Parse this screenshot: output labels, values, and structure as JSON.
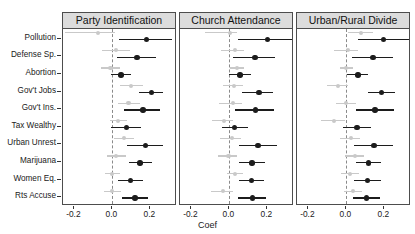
{
  "chart_data": {
    "type": "scatter",
    "title": "",
    "xlabel": "Coef",
    "ylabel": "",
    "xlim": [
      -0.26,
      0.34
    ],
    "xticks": [
      -0.2,
      0.0,
      0.2
    ],
    "xticklabels": [
      "-0.2",
      "0.0",
      "0.2"
    ],
    "grid": false,
    "legend_position": "none",
    "zero_reference_line": 0.0,
    "categories": [
      "Pollution",
      "Defense Sp.",
      "Abortion",
      "Gov't Jobs",
      "Gov't Ins.",
      "Tax Wealthy",
      "Urban Unrest",
      "Marijuana",
      "Women Eq.",
      "Rts Accuse"
    ],
    "panels": [
      {
        "title": "Party Identification",
        "series": [
          {
            "name": "light-estimate",
            "color": "#c9c9c9",
            "points": [
              {
                "category": "Pollution",
                "coef": -0.075,
                "ci_low": -0.25,
                "ci_high": 0.015
              },
              {
                "category": "Defense Sp.",
                "coef": 0.02,
                "ci_low": -0.055,
                "ci_high": 0.092
              },
              {
                "category": "Abortion",
                "coef": -0.01,
                "ci_low": -0.06,
                "ci_high": 0.04
              },
              {
                "category": "Gov't Jobs",
                "coef": 0.1,
                "ci_low": 0.04,
                "ci_high": 0.16
              },
              {
                "category": "Gov't Ins.",
                "coef": 0.085,
                "ci_low": 0.03,
                "ci_high": 0.145
              },
              {
                "category": "Tax Wealthy",
                "coef": 0.03,
                "ci_low": -0.015,
                "ci_high": 0.075
              },
              {
                "category": "Urban Unrest",
                "coef": 0.06,
                "ci_low": 0.01,
                "ci_high": 0.115
              },
              {
                "category": "Marijuana",
                "coef": 0.02,
                "ci_low": -0.03,
                "ci_high": 0.07
              },
              {
                "category": "Women Eq.",
                "coef": 0.0,
                "ci_low": -0.04,
                "ci_high": 0.042
              },
              {
                "category": "Rts Accuse",
                "coef": 0.0,
                "ci_low": -0.045,
                "ci_high": 0.045
              }
            ]
          },
          {
            "name": "dark-estimate",
            "color": "#1c1c1c",
            "points": [
              {
                "category": "Pollution",
                "coef": 0.18,
                "ci_low": 0.035,
                "ci_high": 0.315
              },
              {
                "category": "Defense Sp.",
                "coef": 0.13,
                "ci_low": 0.022,
                "ci_high": 0.228
              },
              {
                "category": "Abortion",
                "coef": 0.045,
                "ci_low": -0.005,
                "ci_high": 0.098
              },
              {
                "category": "Gov't Jobs",
                "coef": 0.205,
                "ci_low": 0.14,
                "ci_high": 0.268
              },
              {
                "category": "Gov't Ins.",
                "coef": 0.16,
                "ci_low": 0.06,
                "ci_high": 0.252
              },
              {
                "category": "Tax Wealthy",
                "coef": 0.075,
                "ci_low": -0.005,
                "ci_high": 0.152
              },
              {
                "category": "Urban Unrest",
                "coef": 0.175,
                "ci_low": 0.078,
                "ci_high": 0.268
              },
              {
                "category": "Marijuana",
                "coef": 0.145,
                "ci_low": 0.085,
                "ci_high": 0.208
              },
              {
                "category": "Women Eq.",
                "coef": 0.095,
                "ci_low": 0.028,
                "ci_high": 0.162
              },
              {
                "category": "Rts Accuse",
                "coef": 0.118,
                "ci_low": 0.05,
                "ci_high": 0.185
              }
            ]
          }
        ]
      },
      {
        "title": "Church Attendance",
        "series": [
          {
            "name": "light-estimate",
            "color": "#c9c9c9",
            "points": [
              {
                "category": "Pollution",
                "coef": 0.005,
                "ci_low": -0.13,
                "ci_high": 0.04
              },
              {
                "category": "Defense Sp.",
                "coef": 0.03,
                "ci_low": -0.045,
                "ci_high": 0.075
              },
              {
                "category": "Abortion",
                "coef": 0.04,
                "ci_low": 0.005,
                "ci_high": 0.078
              },
              {
                "category": "Gov't Jobs",
                "coef": 0.025,
                "ci_low": -0.035,
                "ci_high": 0.072
              },
              {
                "category": "Gov't Ins.",
                "coef": 0.02,
                "ci_low": -0.055,
                "ci_high": 0.065
              },
              {
                "category": "Tax Wealthy",
                "coef": -0.03,
                "ci_low": -0.09,
                "ci_high": 0.018
              },
              {
                "category": "Urban Unrest",
                "coef": 0.015,
                "ci_low": -0.05,
                "ci_high": 0.062
              },
              {
                "category": "Marijuana",
                "coef": -0.005,
                "ci_low": -0.06,
                "ci_high": 0.04
              },
              {
                "category": "Women Eq.",
                "coef": 0.03,
                "ci_low": -0.012,
                "ci_high": 0.072
              },
              {
                "category": "Rts Accuse",
                "coef": -0.035,
                "ci_low": -0.095,
                "ci_high": 0.018
              }
            ]
          },
          {
            "name": "dark-estimate",
            "color": "#1c1c1c",
            "points": [
              {
                "category": "Pollution",
                "coef": 0.2,
                "ci_low": 0.045,
                "ci_high": 0.34
              },
              {
                "category": "Defense Sp.",
                "coef": 0.135,
                "ci_low": 0.02,
                "ci_high": 0.238
              },
              {
                "category": "Abortion",
                "coef": 0.055,
                "ci_low": 0.0,
                "ci_high": 0.112
              },
              {
                "category": "Gov't Jobs",
                "coef": 0.155,
                "ci_low": 0.065,
                "ci_high": 0.232
              },
              {
                "category": "Gov't Ins.",
                "coef": 0.138,
                "ci_low": 0.03,
                "ci_high": 0.235
              },
              {
                "category": "Tax Wealthy",
                "coef": 0.028,
                "ci_low": -0.04,
                "ci_high": 0.098
              },
              {
                "category": "Urban Unrest",
                "coef": 0.15,
                "ci_low": 0.048,
                "ci_high": 0.248
              },
              {
                "category": "Marijuana",
                "coef": 0.118,
                "ci_low": 0.048,
                "ci_high": 0.188
              },
              {
                "category": "Women Eq.",
                "coef": 0.115,
                "ci_low": 0.048,
                "ci_high": 0.182
              },
              {
                "category": "Rts Accuse",
                "coef": 0.12,
                "ci_low": 0.045,
                "ci_high": 0.195
              }
            ]
          }
        ]
      },
      {
        "title": "Urban/Rural Divide",
        "series": [
          {
            "name": "light-estimate",
            "color": "#c9c9c9",
            "points": [
              {
                "category": "Pollution",
                "coef": 0.075,
                "ci_low": 0.01,
                "ci_high": 0.14
              },
              {
                "category": "Defense Sp.",
                "coef": 0.01,
                "ci_low": -0.065,
                "ci_high": 0.062
              },
              {
                "category": "Abortion",
                "coef": 0.0,
                "ci_low": -0.035,
                "ci_high": 0.035
              },
              {
                "category": "Gov't Jobs",
                "coef": -0.045,
                "ci_low": -0.1,
                "ci_high": 0.008
              },
              {
                "category": "Gov't Ins.",
                "coef": 0.0,
                "ci_low": -0.055,
                "ci_high": 0.05
              },
              {
                "category": "Tax Wealthy",
                "coef": -0.065,
                "ci_low": -0.135,
                "ci_high": -0.005
              },
              {
                "category": "Urban Unrest",
                "coef": 0.025,
                "ci_low": -0.035,
                "ci_high": 0.072
              },
              {
                "category": "Marijuana",
                "coef": 0.045,
                "ci_low": -0.005,
                "ci_high": 0.092
              },
              {
                "category": "Women Eq.",
                "coef": 0.02,
                "ci_low": -0.028,
                "ci_high": 0.065
              },
              {
                "category": "Rts Accuse",
                "coef": 0.035,
                "ci_low": -0.015,
                "ci_high": 0.082
              }
            ]
          },
          {
            "name": "dark-estimate",
            "color": "#1c1c1c",
            "points": [
              {
                "category": "Pollution",
                "coef": 0.195,
                "ci_low": 0.06,
                "ci_high": 0.33
              },
              {
                "category": "Defense Sp.",
                "coef": 0.14,
                "ci_low": 0.03,
                "ci_high": 0.245
              },
              {
                "category": "Abortion",
                "coef": 0.06,
                "ci_low": 0.002,
                "ci_high": 0.115
              },
              {
                "category": "Gov't Jobs",
                "coef": 0.185,
                "ci_low": 0.115,
                "ci_high": 0.255
              },
              {
                "category": "Gov't Ins.",
                "coef": 0.15,
                "ci_low": 0.048,
                "ci_high": 0.252
              },
              {
                "category": "Tax Wealthy",
                "coef": 0.055,
                "ci_low": -0.02,
                "ci_high": 0.128
              },
              {
                "category": "Urban Unrest",
                "coef": 0.145,
                "ci_low": 0.042,
                "ci_high": 0.245
              },
              {
                "category": "Marijuana",
                "coef": 0.115,
                "ci_low": 0.048,
                "ci_high": 0.182
              },
              {
                "category": "Women Eq.",
                "coef": 0.112,
                "ci_low": 0.042,
                "ci_high": 0.182
              },
              {
                "category": "Rts Accuse",
                "coef": 0.105,
                "ci_low": 0.035,
                "ci_high": 0.175
              }
            ]
          }
        ]
      }
    ],
    "colors": {
      "point_dark": "#1c1c1c",
      "point_light": "#c9c9c9",
      "strip_background": "#dcdcdc",
      "panel_border": "#4d4d4d",
      "zero_line": "#8a8a8a",
      "background": "#ffffff"
    }
  }
}
